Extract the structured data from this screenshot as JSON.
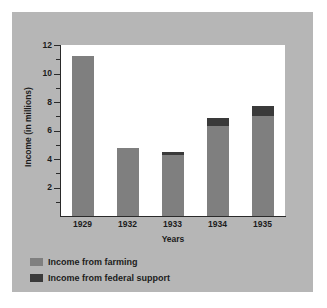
{
  "figure": {
    "background_color": "#ffffff",
    "panel_color": "#b6b6b6",
    "plot_background_color": "#ffffff"
  },
  "chart_data": {
    "type": "bar",
    "stacked": true,
    "title": "",
    "xlabel": "Years",
    "ylabel": "Income (in millions)",
    "categories": [
      "1929",
      "1932",
      "1933",
      "1934",
      "1935"
    ],
    "series": [
      {
        "name": "Income from farming",
        "color": "#7f7f7f",
        "values": [
          11.25,
          4.75,
          4.25,
          6.3,
          7.05
        ]
      },
      {
        "name": "Income from federal support",
        "color": "#3a3a3a",
        "values": [
          0,
          0,
          0.25,
          0.6,
          0.7
        ]
      }
    ],
    "totals": [
      11.25,
      4.75,
      4.5,
      6.9,
      7.75
    ],
    "ylim": [
      0,
      12
    ],
    "ytick_labels": [
      "2",
      "4",
      "6",
      "8",
      "10",
      "12"
    ],
    "ytick_values": [
      2,
      4,
      6,
      8,
      10,
      12
    ],
    "yminor_values": [
      1,
      3,
      5,
      7,
      9,
      11
    ],
    "grid": false,
    "legend_position": "below-left"
  },
  "legend": {
    "entries": [
      {
        "label": "Income from farming",
        "color": "#7f7f7f"
      },
      {
        "label": "Income from federal support",
        "color": "#3a3a3a"
      }
    ]
  }
}
